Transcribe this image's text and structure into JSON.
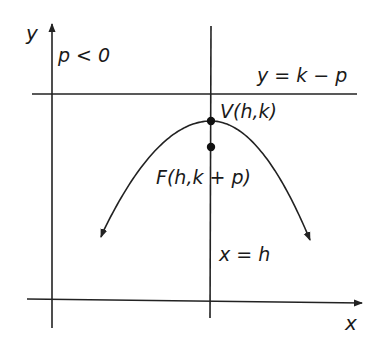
{
  "diagram": {
    "labels": {
      "y_axis": "y",
      "x_axis": "x",
      "condition": "p < 0",
      "directrix": "y = k − p",
      "vertex": "V(h,k)",
      "focus": "F(h,k + p)",
      "axis_of_symmetry": "x = h"
    },
    "elements": [
      {
        "name": "y-axis",
        "type": "arrow"
      },
      {
        "name": "x-axis",
        "type": "arrow"
      },
      {
        "name": "directrix",
        "type": "line"
      },
      {
        "name": "axis-of-symmetry",
        "type": "line"
      },
      {
        "name": "parabola",
        "type": "curve"
      },
      {
        "name": "vertex-point",
        "type": "point"
      },
      {
        "name": "focus-point",
        "type": "point"
      }
    ],
    "colors": {
      "ink": "#222222",
      "background": "#ffffff"
    }
  }
}
